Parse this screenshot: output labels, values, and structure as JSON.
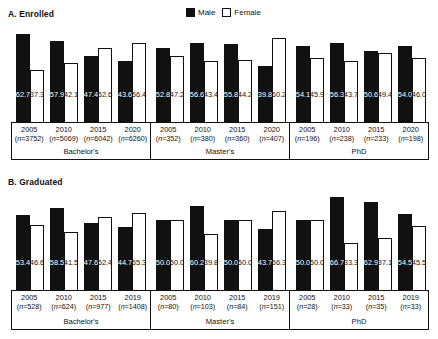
{
  "legend": {
    "male_label": "Male",
    "female_label": "Female",
    "male_color": "#111111",
    "female_color": "#ffffff"
  },
  "panels": [
    {
      "id": "A",
      "title": "A. Enrolled"
    },
    {
      "id": "B",
      "title": "B. Graduated"
    }
  ],
  "chart_data": [
    {
      "type": "bar",
      "title": "A. Enrolled",
      "xlabel": "",
      "ylabel": "",
      "ylim": [
        0,
        70
      ],
      "grid": false,
      "legend_position": "top-center",
      "categories": [
        "2005",
        "2010",
        "2015",
        "2020",
        "2005",
        "2010",
        "2015",
        "2020",
        "2005",
        "2010",
        "2015",
        "2020"
      ],
      "groups": [
        {
          "name": "Bachelor's",
          "points": [
            {
              "year": "2005",
              "n": "(n=3752)",
              "male": 62.7,
              "female": 37.3
            },
            {
              "year": "2010",
              "n": "(n=5069)",
              "male": 57.9,
              "female": 42.1
            },
            {
              "year": "2015",
              "n": "(n=6042)",
              "male": 47.4,
              "female": 52.6
            },
            {
              "year": "2020",
              "n": "(n=6260)",
              "male": 43.6,
              "female": 56.4
            }
          ]
        },
        {
          "name": "Master's",
          "points": [
            {
              "year": "2005",
              "n": "(n=352)",
              "male": 52.8,
              "female": 47.2
            },
            {
              "year": "2010",
              "n": "(n=380)",
              "male": 56.6,
              "female": 43.4
            },
            {
              "year": "2015",
              "n": "(n=360)",
              "male": 55.8,
              "female": 44.2
            },
            {
              "year": "2020",
              "n": "(n=407)",
              "male": 39.8,
              "female": 60.2
            }
          ]
        },
        {
          "name": "PhD",
          "points": [
            {
              "year": "2005",
              "n": "(n=196)",
              "male": 54.1,
              "female": 45.9
            },
            {
              "year": "2010",
              "n": "(n=238)",
              "male": 56.3,
              "female": 43.7
            },
            {
              "year": "2015",
              "n": "(n=233)",
              "male": 50.6,
              "female": 49.4
            },
            {
              "year": "2020",
              "n": "(n=198)",
              "male": 54.0,
              "female": 46.0
            }
          ]
        }
      ],
      "series": [
        {
          "name": "Male",
          "values": [
            62.7,
            57.9,
            47.4,
            43.6,
            52.8,
            56.6,
            55.8,
            39.8,
            54.1,
            56.3,
            50.6,
            54.0
          ]
        },
        {
          "name": "Female",
          "values": [
            37.3,
            42.1,
            52.6,
            56.4,
            47.2,
            43.4,
            44.2,
            60.2,
            45.9,
            43.7,
            49.4,
            46.0
          ]
        }
      ]
    },
    {
      "type": "bar",
      "title": "B. Graduated",
      "xlabel": "",
      "ylabel": "",
      "ylim": [
        0,
        70
      ],
      "grid": false,
      "legend_position": "top-center",
      "categories": [
        "2005",
        "2010",
        "2015",
        "2019",
        "2005",
        "2010",
        "2015",
        "2019",
        "2005",
        "2010",
        "2015",
        "2019"
      ],
      "groups": [
        {
          "name": "Bachelor's",
          "points": [
            {
              "year": "2005",
              "n": "(n=528)",
              "male": 53.4,
              "female": 46.6
            },
            {
              "year": "2010",
              "n": "(n=624)",
              "male": 58.5,
              "female": 41.5
            },
            {
              "year": "2015",
              "n": "(n=977)",
              "male": 47.6,
              "female": 52.4
            },
            {
              "year": "2019",
              "n": "(n=1408)",
              "male": 44.7,
              "female": 55.3
            }
          ]
        },
        {
          "name": "Master's",
          "points": [
            {
              "year": "2005",
              "n": "(n=80)",
              "male": 50.0,
              "female": 50.0
            },
            {
              "year": "2010",
              "n": "(n=103)",
              "male": 60.2,
              "female": 39.8
            },
            {
              "year": "2015",
              "n": "(n=84)",
              "male": 50.0,
              "female": 50.0
            },
            {
              "year": "2019",
              "n": "(n=151)",
              "male": 43.7,
              "female": 56.3
            }
          ]
        },
        {
          "name": "PhD",
          "points": [
            {
              "year": "2005",
              "n": "(n=28)",
              "male": 50.0,
              "female": 50.0
            },
            {
              "year": "2010",
              "n": "(n=33)",
              "male": 66.7,
              "female": 33.3
            },
            {
              "year": "2015",
              "n": "(n=35)",
              "male": 62.9,
              "female": 37.1
            },
            {
              "year": "2019",
              "n": "(n=33)",
              "male": 54.5,
              "female": 45.5
            }
          ]
        }
      ],
      "series": [
        {
          "name": "Male",
          "values": [
            53.4,
            58.5,
            47.6,
            44.7,
            50.0,
            60.2,
            50.0,
            43.7,
            50.0,
            66.7,
            62.9,
            54.5
          ]
        },
        {
          "name": "Female",
          "values": [
            46.6,
            41.5,
            52.4,
            55.3,
            50.0,
            39.8,
            50.0,
            56.3,
            50.0,
            33.3,
            37.1,
            45.5
          ]
        }
      ]
    }
  ]
}
